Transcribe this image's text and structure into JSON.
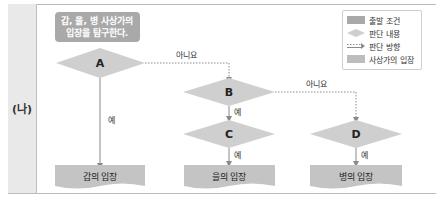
{
  "section_label": "(나)",
  "start_box": {
    "line1": "갑, 을, 병 사상가의",
    "line2": "입장을 탐구한다."
  },
  "decisions": {
    "A": "A",
    "B": "B",
    "C": "C",
    "D": "D"
  },
  "edge_labels": {
    "a_no": "아니요",
    "a_yes": "예",
    "b_no": "아니요",
    "b_yes": "예",
    "c_yes": "예",
    "d_yes": "예"
  },
  "positions": {
    "gap": "갑의 입장",
    "eul": "을의 입장",
    "byeong": "병의 입장"
  },
  "legend": {
    "items": [
      {
        "icon": "start-box-swatch",
        "label": "출발 조건"
      },
      {
        "icon": "diamond-swatch",
        "label": "판단 내용"
      },
      {
        "icon": "arrow-swatch",
        "label": "판단 방향"
      },
      {
        "icon": "position-swatch",
        "label": "사상가의 입장"
      }
    ]
  },
  "colors": {
    "start_fill": "#a9a9a9",
    "diamond_fill": "#cfcfcf",
    "position_fill": "#c4c4c4",
    "line": "#8a8a8a",
    "panel": "#e9e9e9"
  }
}
